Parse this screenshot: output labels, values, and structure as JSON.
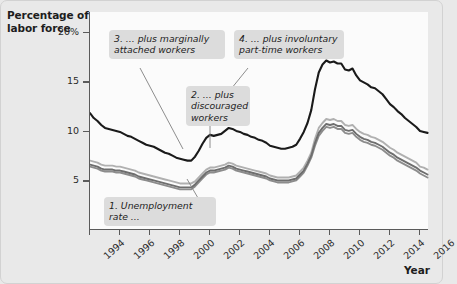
{
  "chart_data": {
    "type": "line",
    "title": "",
    "xlabel": "Year",
    "ylabel": "Percentage of\nlabor force",
    "ylabel_line1": "Percentage of",
    "ylabel_line2": "labor force",
    "xlim": [
      1994,
      2016.6
    ],
    "ylim": [
      0,
      22
    ],
    "grid": false,
    "legend": "none (annotated callouts)",
    "ytick_labels": [
      "20%",
      "15",
      "10",
      "5"
    ],
    "ytick_values": [
      20,
      15,
      10,
      5
    ],
    "xtick_labels": [
      "1994",
      "1996",
      "1998",
      "2000",
      "2002",
      "2004",
      "2006",
      "2008",
      "2010",
      "2012",
      "2014",
      "2016"
    ],
    "xtick_values": [
      1994,
      1996,
      1998,
      2000,
      2002,
      2004,
      2006,
      2008,
      2010,
      2012,
      2014,
      2016
    ],
    "x": [
      1994.0,
      1994.25,
      1994.5,
      1994.75,
      1995.0,
      1995.25,
      1995.5,
      1995.75,
      1996.0,
      1996.25,
      1996.5,
      1996.75,
      1997.0,
      1997.25,
      1997.5,
      1997.75,
      1998.0,
      1998.25,
      1998.5,
      1998.75,
      1999.0,
      1999.25,
      1999.5,
      1999.75,
      2000.0,
      2000.25,
      2000.5,
      2000.75,
      2001.0,
      2001.25,
      2001.5,
      2001.75,
      2002.0,
      2002.25,
      2002.5,
      2002.75,
      2003.0,
      2003.25,
      2003.5,
      2003.75,
      2004.0,
      2004.25,
      2004.5,
      2004.75,
      2005.0,
      2005.25,
      2005.5,
      2005.75,
      2006.0,
      2006.25,
      2006.5,
      2006.75,
      2007.0,
      2007.25,
      2007.5,
      2007.75,
      2008.0,
      2008.25,
      2008.5,
      2008.75,
      2009.0,
      2009.25,
      2009.5,
      2009.75,
      2010.0,
      2010.25,
      2010.5,
      2010.75,
      2011.0,
      2011.25,
      2011.5,
      2011.75,
      2012.0,
      2012.25,
      2012.5,
      2012.75,
      2013.0,
      2013.25,
      2013.5,
      2013.75,
      2014.0,
      2014.25,
      2014.5,
      2014.75,
      2015.0,
      2015.25,
      2015.5,
      2015.75,
      2016.0,
      2016.25,
      2016.5
    ],
    "series": [
      {
        "name": "4. ...plus involuntary part-time workers",
        "measure": "U-6",
        "color": "#1a1a1a",
        "width": 2.1,
        "values": [
          11.8,
          11.3,
          11.0,
          10.6,
          10.3,
          10.2,
          10.1,
          10.0,
          9.9,
          9.7,
          9.5,
          9.4,
          9.2,
          9.0,
          8.8,
          8.6,
          8.5,
          8.4,
          8.2,
          8.0,
          7.8,
          7.7,
          7.5,
          7.3,
          7.2,
          7.1,
          7.0,
          7.0,
          7.4,
          8.0,
          8.7,
          9.3,
          9.6,
          9.5,
          9.6,
          9.7,
          10.0,
          10.3,
          10.2,
          10.0,
          9.9,
          9.7,
          9.6,
          9.4,
          9.3,
          9.1,
          9.0,
          8.8,
          8.5,
          8.4,
          8.3,
          8.2,
          8.2,
          8.3,
          8.4,
          8.6,
          9.2,
          9.9,
          10.8,
          12.1,
          14.2,
          15.9,
          16.7,
          17.1,
          16.9,
          17.0,
          16.8,
          16.8,
          16.2,
          16.1,
          16.3,
          15.6,
          15.1,
          14.9,
          14.7,
          14.4,
          14.3,
          14.0,
          13.7,
          13.2,
          12.7,
          12.4,
          12.0,
          11.7,
          11.3,
          11.0,
          10.7,
          10.4,
          10.0,
          9.9,
          9.8
        ]
      },
      {
        "name": "3. ...plus marginally attached workers",
        "measure": "U-5",
        "color": "#b0b0b0",
        "width": 1.9,
        "values": [
          7.0,
          6.9,
          6.8,
          6.6,
          6.5,
          6.5,
          6.5,
          6.4,
          6.4,
          6.3,
          6.2,
          6.1,
          6.0,
          5.8,
          5.7,
          5.6,
          5.5,
          5.4,
          5.3,
          5.2,
          5.1,
          5.0,
          4.9,
          4.8,
          4.7,
          4.7,
          4.7,
          4.7,
          4.9,
          5.3,
          5.7,
          6.1,
          6.3,
          6.3,
          6.4,
          6.5,
          6.6,
          6.8,
          6.7,
          6.5,
          6.4,
          6.3,
          6.2,
          6.1,
          6.0,
          5.9,
          5.8,
          5.7,
          5.5,
          5.4,
          5.3,
          5.3,
          5.3,
          5.3,
          5.4,
          5.5,
          5.9,
          6.3,
          7.0,
          7.8,
          9.2,
          10.3,
          10.8,
          11.2,
          11.1,
          11.2,
          11.0,
          11.0,
          10.6,
          10.5,
          10.6,
          10.2,
          9.9,
          9.7,
          9.6,
          9.4,
          9.3,
          9.1,
          8.9,
          8.6,
          8.3,
          8.1,
          7.8,
          7.6,
          7.4,
          7.2,
          7.0,
          6.8,
          6.4,
          6.3,
          6.1
        ]
      },
      {
        "name": "2. ...plus discouraged workers",
        "measure": "U-4",
        "color": "#6e6e6e",
        "width": 1.9,
        "values": [
          6.6,
          6.5,
          6.4,
          6.2,
          6.1,
          6.1,
          6.1,
          6.0,
          6.0,
          5.9,
          5.8,
          5.7,
          5.6,
          5.4,
          5.3,
          5.2,
          5.1,
          5.0,
          4.9,
          4.8,
          4.7,
          4.6,
          4.5,
          4.4,
          4.3,
          4.3,
          4.3,
          4.3,
          4.6,
          5.0,
          5.4,
          5.8,
          6.0,
          6.0,
          6.1,
          6.2,
          6.3,
          6.5,
          6.4,
          6.2,
          6.1,
          6.0,
          5.9,
          5.8,
          5.7,
          5.6,
          5.5,
          5.4,
          5.2,
          5.1,
          5.0,
          5.0,
          5.0,
          5.0,
          5.1,
          5.2,
          5.6,
          6.0,
          6.7,
          7.5,
          8.8,
          9.8,
          10.3,
          10.7,
          10.6,
          10.7,
          10.5,
          10.5,
          10.1,
          10.0,
          10.1,
          9.7,
          9.4,
          9.2,
          9.1,
          8.9,
          8.8,
          8.6,
          8.4,
          8.1,
          7.8,
          7.6,
          7.3,
          7.1,
          6.9,
          6.7,
          6.5,
          6.3,
          6.0,
          5.8,
          5.6
        ]
      },
      {
        "name": "1. Unemployment rate...",
        "measure": "U-3",
        "color": "#8c8c8c",
        "width": 1.9,
        "values": [
          6.4,
          6.3,
          6.2,
          6.0,
          5.9,
          5.9,
          5.9,
          5.8,
          5.8,
          5.7,
          5.6,
          5.5,
          5.4,
          5.2,
          5.1,
          5.0,
          4.9,
          4.8,
          4.7,
          4.6,
          4.5,
          4.4,
          4.3,
          4.2,
          4.1,
          4.1,
          4.1,
          4.1,
          4.4,
          4.8,
          5.2,
          5.6,
          5.8,
          5.8,
          5.9,
          6.0,
          6.1,
          6.3,
          6.2,
          6.0,
          5.9,
          5.8,
          5.7,
          5.6,
          5.5,
          5.4,
          5.3,
          5.2,
          5.0,
          4.9,
          4.8,
          4.8,
          4.8,
          4.8,
          4.9,
          5.0,
          5.4,
          5.8,
          6.5,
          7.3,
          8.5,
          9.5,
          10.0,
          10.4,
          10.3,
          10.4,
          10.2,
          10.2,
          9.8,
          9.7,
          9.8,
          9.4,
          9.1,
          8.9,
          8.8,
          8.6,
          8.5,
          8.3,
          8.1,
          7.8,
          7.5,
          7.3,
          7.0,
          6.8,
          6.6,
          6.4,
          6.2,
          6.0,
          5.7,
          5.5,
          5.3
        ]
      }
    ],
    "annotations": [
      {
        "id": "callout-1",
        "text": "1. Unemployment rate ...",
        "target_series": "U-3"
      },
      {
        "id": "callout-2",
        "text": "2. ... plus\ndiscouraged\nworkers",
        "target_series": "U-4"
      },
      {
        "id": "callout-3",
        "text": "3. ... plus marginally\nattached workers",
        "target_series": "U-5"
      },
      {
        "id": "callout-4",
        "text": "4. ... plus involuntary\npart-time workers",
        "target_series": "U-6"
      }
    ]
  },
  "axes": {
    "y_label_line1": "Percentage of",
    "y_label_line2": "labor force",
    "x_title": "Year"
  },
  "colors": {
    "background": "#e9e9e9",
    "plot_background": "#fbfbfb",
    "axis": "#5a5a5a",
    "callout_background": "#dcdcdc",
    "series_u6": "#1a1a1a",
    "series_u5": "#b0b0b0",
    "series_u4": "#6e6e6e",
    "series_u3": "#8c8c8c"
  }
}
